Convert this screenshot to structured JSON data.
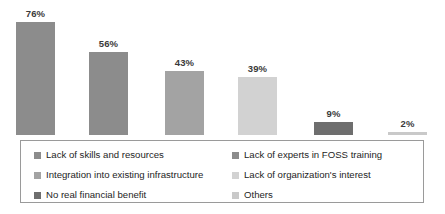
{
  "chart_data": {
    "type": "bar",
    "title": "",
    "subtitle": "",
    "xlabel": "",
    "ylabel": "",
    "ylim": [
      0,
      80
    ],
    "grid": false,
    "legend_position": "bottom",
    "categories": [
      "Lack of skills and resources",
      "Lack of experts in FOSS training",
      "Integration into existing infrastructure",
      "Lack of organization's interest",
      "No real financial benefit",
      "Others"
    ],
    "values": [
      76,
      56,
      43,
      39,
      9,
      2
    ],
    "value_labels": [
      "76%",
      "56%",
      "43%",
      "39%",
      "9%",
      "2%"
    ],
    "colors": [
      "#8c8c8c",
      "#8c8c8c",
      "#a3a3a3",
      "#d2d2d2",
      "#6e6e6e",
      "#c9c9c9"
    ]
  },
  "bars": [
    {
      "label": "76%",
      "value": 76,
      "color": "#8c8c8c",
      "left": 16
    },
    {
      "label": "56%",
      "value": 56,
      "color": "#8c8c8c",
      "left": 89
    },
    {
      "label": "43%",
      "value": 43,
      "color": "#a3a3a3",
      "left": 165
    },
    {
      "label": "39%",
      "value": 39,
      "color": "#d2d2d2",
      "left": 238
    },
    {
      "label": "9%",
      "value": 9,
      "color": "#6e6e6e",
      "left": 314
    },
    {
      "label": "2%",
      "value": 2,
      "color": "#c9c9c9",
      "left": 388
    }
  ],
  "legend": {
    "left_column": [
      {
        "label": "Lack of skills and resources",
        "color": "#8c8c8c"
      },
      {
        "label": "Integration into existing infrastructure",
        "color": "#a3a3a3"
      },
      {
        "label": "No real financial benefit",
        "color": "#6e6e6e"
      }
    ],
    "right_column": [
      {
        "label": "Lack of experts in FOSS training",
        "color": "#8c8c8c"
      },
      {
        "label": "Lack of organization's interest",
        "color": "#d2d2d2"
      },
      {
        "label": "Others",
        "color": "#c9c9c9"
      }
    ]
  }
}
